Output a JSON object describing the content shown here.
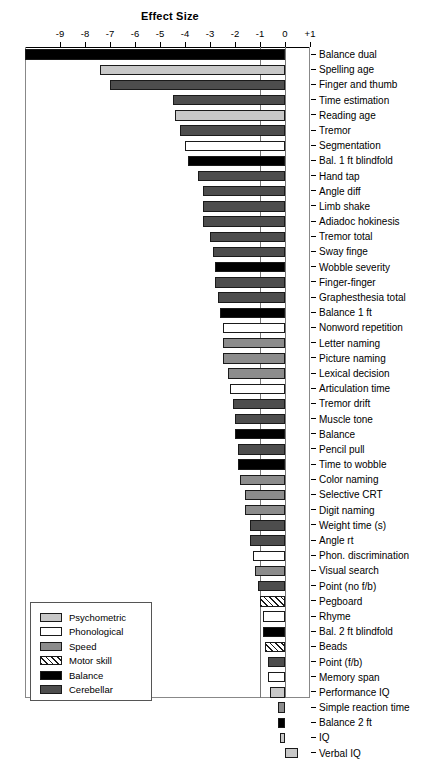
{
  "chart_data": {
    "type": "bar",
    "orientation": "horizontal",
    "title": "Effect Size",
    "xlabel": "",
    "ylabel": "",
    "xlim": [
      -10.4,
      1.0
    ],
    "grid": "vertical lines at -1 and 0",
    "tick_labels": [
      "-9",
      "-8",
      "-7",
      "-6",
      "-5",
      "-4",
      "-3",
      "-2",
      "-1",
      "0",
      "+1"
    ],
    "tick_values": [
      -9,
      -8,
      -7,
      -6,
      -5,
      -4,
      -3,
      -2,
      -1,
      0,
      1
    ],
    "legend_position": "bottom-left",
    "legend": [
      {
        "label": "Psychometric",
        "key": "psychometric",
        "color": "#c8c8c8"
      },
      {
        "label": "Phonological",
        "key": "phonological",
        "color": "#ffffff"
      },
      {
        "label": "Speed",
        "key": "speed",
        "color": "#8c8c8c"
      },
      {
        "label": "Motor skill",
        "key": "motor",
        "color": "#ffffff"
      },
      {
        "label": "Balance",
        "key": "balance",
        "color": "#000000"
      },
      {
        "label": "Cerebellar",
        "key": "cerebellar",
        "color": "#4d4d4d"
      }
    ],
    "categories": [
      "Balance dual",
      "Spelling age",
      "Finger and thumb",
      "Time estimation",
      "Reading age",
      "Tremor",
      "Segmentation",
      "Bal. 1 ft blindfold",
      "Hand tap",
      "Angle diff",
      "Limb shake",
      "Adiadoc hokinesis",
      "Tremor total",
      "Sway finge",
      "Wobble severity",
      "Finger-finger",
      "Graphesthesia total",
      "Balance 1 ft",
      "Nonword repetition",
      "Letter naming",
      "Picture naming",
      "Lexical decision",
      "Articulation time",
      "Tremor drift",
      "Muscle tone",
      "Balance",
      "Pencil pull",
      "Time to wobble",
      "Color naming",
      "Selective CRT",
      "Digit naming",
      "Weight time (s)",
      "Angle rt",
      "Phon. discrimination",
      "Visual search",
      "Point (no f/b)",
      "Pegboard",
      "Rhyme",
      "Bal. 2 ft blindfold",
      "Beads",
      "Point (f/b)",
      "Memory span",
      "Performance IQ",
      "Simple reaction time",
      "Balance 2 ft",
      "IQ",
      "Verbal IQ"
    ],
    "values": [
      -10.4,
      -7.4,
      -7.0,
      -4.5,
      -4.4,
      -4.2,
      -4.0,
      -3.9,
      -3.5,
      -3.3,
      -3.3,
      -3.3,
      -3.0,
      -2.9,
      -2.8,
      -2.8,
      -2.7,
      -2.6,
      -2.5,
      -2.5,
      -2.5,
      -2.3,
      -2.2,
      -2.1,
      -2.0,
      -2.0,
      -1.9,
      -1.9,
      -1.8,
      -1.6,
      -1.6,
      -1.4,
      -1.4,
      -1.3,
      -1.2,
      -1.1,
      -1.0,
      -0.9,
      -0.9,
      -0.8,
      -0.7,
      -0.7,
      -0.6,
      -0.3,
      -0.3,
      -0.2,
      0.5
    ],
    "series_category": [
      "balance",
      "psychometric",
      "cerebellar",
      "cerebellar",
      "psychometric",
      "cerebellar",
      "phonological",
      "balance",
      "cerebellar",
      "cerebellar",
      "cerebellar",
      "cerebellar",
      "cerebellar",
      "cerebellar",
      "balance",
      "cerebellar",
      "cerebellar",
      "balance",
      "phonological",
      "speed",
      "speed",
      "speed",
      "phonological",
      "cerebellar",
      "cerebellar",
      "balance",
      "cerebellar",
      "balance",
      "speed",
      "speed",
      "speed",
      "cerebellar",
      "cerebellar",
      "phonological",
      "speed",
      "cerebellar",
      "motor",
      "phonological",
      "balance",
      "motor",
      "cerebellar",
      "phonological",
      "psychometric",
      "speed",
      "balance",
      "psychometric",
      "psychometric"
    ]
  }
}
